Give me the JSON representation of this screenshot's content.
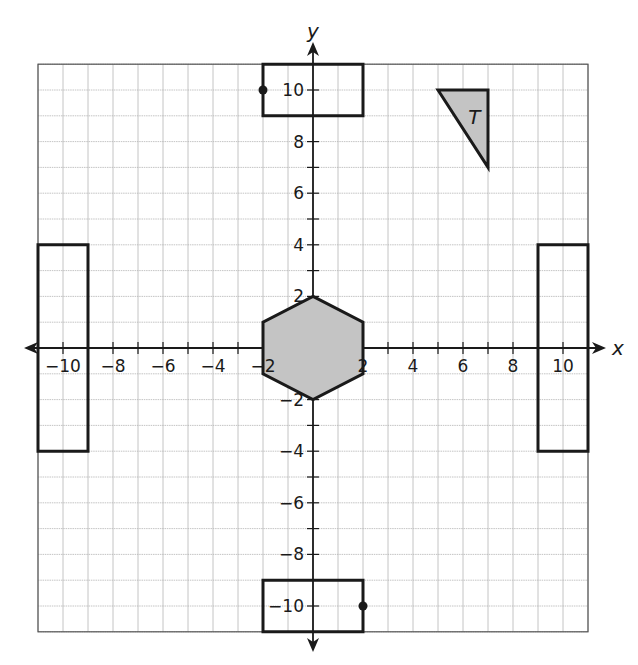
{
  "figure": {
    "type": "coordinate-plane",
    "x_axis_label": "x",
    "y_axis_label": "y",
    "range": {
      "xmin": -11,
      "xmax": 11,
      "ymin": -11,
      "ymax": 11
    },
    "grid_step": 1,
    "x_tick_labels": [
      "-10",
      "-8",
      "-6",
      "-4",
      "-2",
      "2",
      "4",
      "6",
      "8",
      "10"
    ],
    "x_tick_values": [
      -10,
      -8,
      -6,
      -4,
      -2,
      2,
      4,
      6,
      8,
      10
    ],
    "y_tick_labels": [
      "10",
      "8",
      "6",
      "4",
      "2",
      "-2",
      "-4",
      "-6",
      "-8",
      "-10"
    ],
    "y_tick_values": [
      10,
      8,
      6,
      4,
      2,
      -2,
      -4,
      -6,
      -8,
      -10
    ],
    "colors": {
      "grid": "#b5b5b5",
      "axis": "#1a1a1a",
      "shape_stroke": "#1a1a1a",
      "shape_fill": "#c4c4c4",
      "background": "#ffffff"
    },
    "shapes": [
      {
        "name": "triangle-T",
        "label": "T",
        "filled": true,
        "points": [
          [
            5,
            10
          ],
          [
            7,
            10
          ],
          [
            7,
            7
          ]
        ]
      },
      {
        "name": "hexagon",
        "label": "",
        "filled": true,
        "points": [
          [
            0,
            2
          ],
          [
            2,
            1
          ],
          [
            2,
            -1
          ],
          [
            0,
            -2
          ],
          [
            -2,
            -1
          ],
          [
            -2,
            1
          ]
        ]
      },
      {
        "name": "rectangle-top",
        "label": "",
        "filled": false,
        "points": [
          [
            -2,
            11
          ],
          [
            2,
            11
          ],
          [
            2,
            9
          ],
          [
            -2,
            9
          ]
        ],
        "marked_point": [
          -2,
          10
        ]
      },
      {
        "name": "rectangle-bottom",
        "label": "",
        "filled": false,
        "points": [
          [
            -2,
            -9
          ],
          [
            2,
            -9
          ],
          [
            2,
            -11
          ],
          [
            -2,
            -11
          ]
        ],
        "marked_point": [
          2,
          -10
        ]
      },
      {
        "name": "rectangle-left",
        "label": "",
        "filled": false,
        "points": [
          [
            -11,
            4
          ],
          [
            -9,
            4
          ],
          [
            -9,
            -4
          ],
          [
            -11,
            -4
          ]
        ]
      },
      {
        "name": "rectangle-right",
        "label": "",
        "filled": false,
        "points": [
          [
            9,
            4
          ],
          [
            11,
            4
          ],
          [
            11,
            -4
          ],
          [
            9,
            -4
          ]
        ]
      }
    ]
  }
}
